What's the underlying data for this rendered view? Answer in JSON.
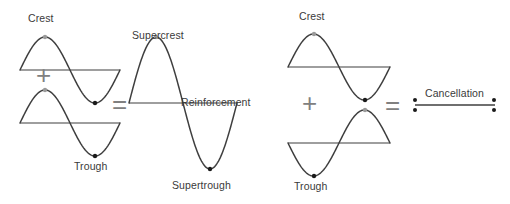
{
  "figure": {
    "background_color": "#ffffff",
    "wave_stroke_color": "#3f3f3f",
    "operator_color": "#808080",
    "label_color": "#3a3a3a",
    "dot_color": "#1a1a1a",
    "dot_color_light": "#9a9a9a"
  },
  "groups": [
    {
      "name": "reinforcement",
      "operator_plus": "+",
      "operator_equals": "=",
      "input_waves": [
        {
          "name": "wave-top-left",
          "phase": "crest-first",
          "label": "Crest",
          "label_position": "above-crest"
        },
        {
          "name": "wave-bottom-left",
          "phase": "crest-first",
          "label": "Trough",
          "label_position": "below-trough"
        }
      ],
      "result_wave": {
        "name": "wave-result-reinforcement",
        "phase": "crest-first",
        "amplitude_relative": 2,
        "crest_label": "Supercrest",
        "trough_label": "Supertrough",
        "baseline_label": "Reinforcement"
      }
    },
    {
      "name": "cancellation",
      "operator_plus": "+",
      "operator_equals": "=",
      "input_waves": [
        {
          "name": "wave-top-right",
          "phase": "crest-first",
          "label": "Crest",
          "label_position": "above-crest"
        },
        {
          "name": "wave-bottom-right",
          "phase": "trough-first",
          "label": "Trough",
          "label_position": "below-trough"
        }
      ],
      "result_wave": {
        "name": "wave-result-cancellation",
        "phase": "flat",
        "amplitude_relative": 0,
        "baseline_label": "Cancellation"
      }
    }
  ],
  "labels": {
    "crest_left": "Crest",
    "trough_left": "Trough",
    "supercrest": "Supercrest",
    "supertrough": "Supertrough",
    "reinforcement": "Reinforcement",
    "crest_right": "Crest",
    "trough_right": "Trough",
    "cancellation": "Cancellation",
    "plus_left": "+",
    "equals_left": "=",
    "plus_right": "+",
    "equals_right": "="
  },
  "chart_data": {
    "type": "line",
    "xlabel": "",
    "ylabel": "",
    "grid": false,
    "legend": "none",
    "series": [
      {
        "name": "wave-top-left",
        "group": "reinforcement",
        "role": "input",
        "baseline_y": 70,
        "x_start": 20,
        "x_end": 120,
        "amplitude": 33,
        "phase": "crest-first",
        "cycles": 1
      },
      {
        "name": "wave-bottom-left",
        "group": "reinforcement",
        "role": "input",
        "baseline_y": 123,
        "x_start": 20,
        "x_end": 120,
        "amplitude": 33,
        "phase": "crest-first",
        "cycles": 1
      },
      {
        "name": "wave-result-reinforcement",
        "group": "reinforcement",
        "role": "result",
        "baseline_y": 103,
        "x_start": 129,
        "x_end": 237,
        "amplitude": 66,
        "phase": "crest-first",
        "cycles": 1
      },
      {
        "name": "wave-top-right",
        "group": "cancellation",
        "role": "input",
        "baseline_y": 67,
        "x_start": 288,
        "x_end": 390,
        "amplitude": 33,
        "phase": "crest-first",
        "cycles": 1
      },
      {
        "name": "wave-bottom-right",
        "group": "cancellation",
        "role": "input",
        "baseline_y": 143,
        "x_start": 288,
        "x_end": 390,
        "amplitude": 33,
        "phase": "trough-first",
        "cycles": 1
      },
      {
        "name": "wave-result-cancellation",
        "group": "cancellation",
        "role": "result",
        "baseline_y": 105,
        "x_start": 415,
        "x_end": 495,
        "amplitude": 0,
        "phase": "flat",
        "cycles": 0
      }
    ],
    "markers": [
      {
        "name": "crest-marker-top-left",
        "x": 45,
        "y": 37,
        "kind": "crest"
      },
      {
        "name": "trough-marker-top-left",
        "x": 95,
        "y": 103,
        "kind": "trough"
      },
      {
        "name": "crest-marker-bottom-left",
        "x": 45,
        "y": 90,
        "kind": "crest"
      },
      {
        "name": "trough-marker-bottom-left",
        "x": 95,
        "y": 156,
        "kind": "trough"
      },
      {
        "name": "supercrest-marker",
        "x": 156,
        "y": 37,
        "kind": "crest"
      },
      {
        "name": "supertrough-marker",
        "x": 210,
        "y": 169,
        "kind": "trough"
      },
      {
        "name": "crest-marker-top-right",
        "x": 314,
        "y": 34,
        "kind": "crest"
      },
      {
        "name": "trough-marker-top-right",
        "x": 365,
        "y": 100,
        "kind": "trough"
      },
      {
        "name": "trough-marker-bottom-right",
        "x": 314,
        "y": 176,
        "kind": "trough"
      },
      {
        "name": "crest-marker-bottom-right",
        "x": 365,
        "y": 110,
        "kind": "crest"
      },
      {
        "name": "cancel-dot-left-upper",
        "x": 415,
        "y": 100,
        "kind": "endpoint"
      },
      {
        "name": "cancel-dot-left-lower",
        "x": 415,
        "y": 110,
        "kind": "endpoint"
      },
      {
        "name": "cancel-dot-right-upper",
        "x": 494,
        "y": 100,
        "kind": "endpoint"
      },
      {
        "name": "cancel-dot-right-lower",
        "x": 494,
        "y": 110,
        "kind": "endpoint"
      }
    ]
  }
}
